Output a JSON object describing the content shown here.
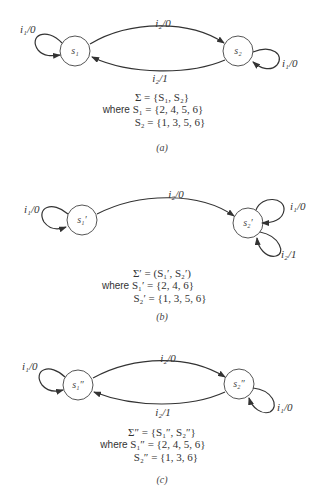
{
  "diagrams": [
    {
      "id": "a",
      "caption": "(a)",
      "states": [
        "s₁",
        "s₂"
      ],
      "transitions": {
        "s1_self": "i₁/0",
        "s1_to_s2": "i₂/0",
        "s2_to_s1": "i₂/1",
        "s2_self": "i₁/0"
      },
      "equations": {
        "sigma": "Σ = {S₁, S₂}",
        "where_prefix": "where",
        "s1_set": "S₁ = {2, 4, 5, 6}",
        "s2_set": "S₂ = {1, 3, 5, 6}"
      }
    },
    {
      "id": "b",
      "caption": "(b)",
      "states": [
        "s₁′",
        "s₂′"
      ],
      "transitions": {
        "s1_self": "i₁/0",
        "s1_to_s2": "i₂/0",
        "s2_self_1": "i₁/0",
        "s2_self_2": "i₂/1"
      },
      "equations": {
        "sigma": "Σ′ = (S₁′, S₂′)",
        "where_prefix": "where",
        "s1_set": "S₁′ = {2, 4, 6}",
        "s2_set": "S₂′ = {1, 3, 5, 6}"
      }
    },
    {
      "id": "c",
      "caption": "(c)",
      "states": [
        "s₁″",
        "s₂″"
      ],
      "transitions": {
        "s1_self": "i₁/0",
        "s1_to_s2": "i₂/0",
        "s2_to_s1": "i₂/1",
        "s2_self": "i₁/0"
      },
      "equations": {
        "sigma": "Σ″ = {S₁″, S₂″}",
        "where_prefix": "where",
        "s1_set": "S₁″ = {2, 4, 5, 6}",
        "s2_set": "S₂″ = {1, 3, 6}"
      }
    }
  ]
}
